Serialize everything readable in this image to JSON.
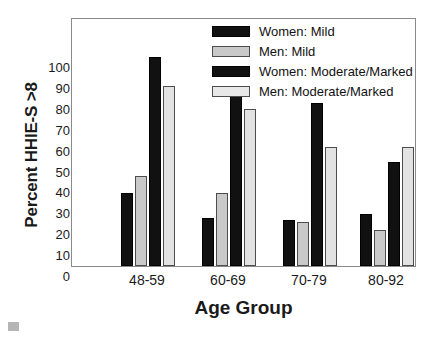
{
  "chart_data": {
    "type": "bar",
    "title": "",
    "xlabel": "Age Group",
    "ylabel": "Percent HHIE-S >8",
    "categories": [
      "48-59",
      "60-69",
      "70-79",
      "80-92"
    ],
    "ylim": [
      0,
      100
    ],
    "yticks": [
      0,
      10,
      20,
      30,
      40,
      50,
      60,
      70,
      80,
      90,
      100
    ],
    "ytick_labels": [
      "0",
      "10",
      "20",
      "30",
      "40",
      "50",
      "60",
      "70",
      "80",
      "90",
      "100"
    ],
    "grid": false,
    "legend_position": "top-right",
    "series": [
      {
        "name": "Women: Mild",
        "color": "#111111",
        "style": "dark",
        "values": [
          35,
          23,
          22,
          25
        ]
      },
      {
        "name": "Men: Mild",
        "color": "#c9c9c9",
        "style": "light",
        "values": [
          43,
          35,
          21,
          17
        ]
      },
      {
        "name": "Women: Moderate/Marked",
        "color": "#111111",
        "style": "dark",
        "values": [
          100,
          84,
          78,
          50
        ]
      },
      {
        "name": "Men: Moderate/Marked",
        "color": "#e2e2e2",
        "style": "light2",
        "values": [
          86,
          75,
          57,
          57
        ]
      }
    ]
  },
  "legend": {
    "items": [
      {
        "label": "Women: Mild",
        "style": "dark"
      },
      {
        "label": "Men: Mild",
        "style": "light"
      },
      {
        "label": "Women: Moderate/Marked",
        "style": "dark"
      },
      {
        "label": "Men: Moderate/Marked",
        "style": "light2"
      }
    ]
  }
}
